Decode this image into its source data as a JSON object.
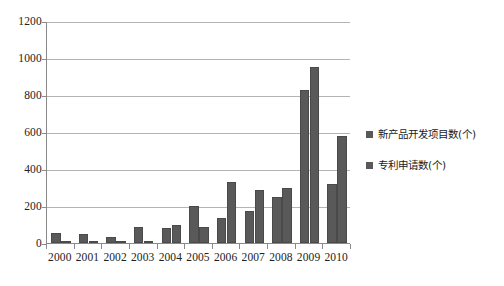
{
  "chart_data": {
    "type": "bar",
    "title": "",
    "subtitle": "",
    "xlabel": "",
    "ylabel": "",
    "categories": [
      "2000",
      "2001",
      "2002",
      "2003",
      "2004",
      "2005",
      "2006",
      "2007",
      "2008",
      "2009",
      "2010"
    ],
    "series": [
      {
        "name": "新产品开发项目数(个)",
        "values": [
          55,
          48,
          30,
          85,
          80,
          200,
          133,
          172,
          250,
          825,
          320
        ],
        "color": "#595959"
      },
      {
        "name": "专利申请数(个)",
        "values": [
          3,
          12,
          8,
          3,
          100,
          85,
          328,
          285,
          298,
          950,
          578
        ],
        "color": "#595959"
      }
    ],
    "ylim": [
      0,
      1200
    ],
    "y_ticks": [
      0,
      200,
      400,
      600,
      800,
      1000,
      1200
    ],
    "y_tick_labels": [
      "0",
      "200",
      "400",
      "600",
      "800",
      "1000",
      "1200"
    ],
    "grid": true,
    "grid_axis": "y",
    "legend_position": "right",
    "axis_color": "#8a8a8a",
    "grid_color": "#b4b4b4",
    "background_color": "#ffffff"
  },
  "legend": {
    "items": [
      {
        "label": "新产品开发项目数(个)",
        "swatch_color": "#595959",
        "icon": "square-swatch-icon"
      },
      {
        "label": "专利申请数(个)",
        "swatch_color": "#595959",
        "icon": "square-swatch-icon"
      }
    ]
  }
}
